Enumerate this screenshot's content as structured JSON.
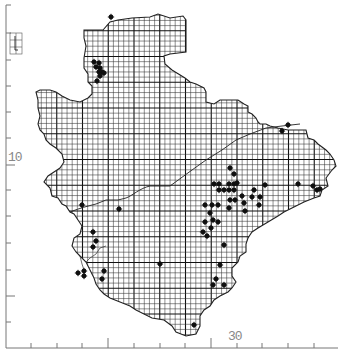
{
  "map": {
    "title": "",
    "axis_labels": {
      "left_10": "10",
      "bottom_30": "30"
    },
    "colors": {
      "background": "#ffffff",
      "grid": "#333333",
      "heavy_grid": "#111111",
      "outline": "#222222",
      "dot": "#111111",
      "axis": "#777777",
      "label": "#888888"
    },
    "grid": {
      "origin_x": 31,
      "origin_y": 5,
      "cell": 5.15,
      "major_every": 5
    },
    "left_ticks_y": [
      5,
      33,
      60,
      86,
      112,
      138,
      165,
      190,
      216,
      243,
      270,
      296,
      322
    ],
    "bottom_ticks_x": [
      31,
      57,
      82,
      108,
      134,
      160,
      185,
      211,
      237,
      262,
      288,
      314
    ],
    "records": [
      [
        111,
        17
      ],
      [
        94,
        62
      ],
      [
        99,
        63
      ],
      [
        96,
        67
      ],
      [
        100,
        68
      ],
      [
        99,
        72
      ],
      [
        102,
        72
      ],
      [
        100,
        76
      ],
      [
        97,
        81
      ],
      [
        104,
        73
      ],
      [
        288,
        125
      ],
      [
        282,
        131
      ],
      [
        230,
        168
      ],
      [
        234,
        174
      ],
      [
        214,
        184
      ],
      [
        219,
        184
      ],
      [
        229,
        184
      ],
      [
        234,
        184
      ],
      [
        219,
        190
      ],
      [
        224,
        190
      ],
      [
        229,
        190
      ],
      [
        234,
        190
      ],
      [
        237,
        183
      ],
      [
        242,
        196
      ],
      [
        265,
        185
      ],
      [
        298,
        184
      ],
      [
        313,
        186
      ],
      [
        317,
        190
      ],
      [
        320,
        189
      ],
      [
        230,
        200
      ],
      [
        235,
        200
      ],
      [
        229,
        208
      ],
      [
        254,
        190
      ],
      [
        252,
        197
      ],
      [
        260,
        197
      ],
      [
        245,
        211
      ],
      [
        259,
        205
      ],
      [
        244,
        203
      ],
      [
        205,
        205
      ],
      [
        212,
        205
      ],
      [
        218,
        205
      ],
      [
        210,
        213
      ],
      [
        213,
        220
      ],
      [
        205,
        222
      ],
      [
        218,
        222
      ],
      [
        211,
        228
      ],
      [
        203,
        232
      ],
      [
        207,
        236
      ],
      [
        82,
        205
      ],
      [
        119,
        209
      ],
      [
        93,
        232
      ],
      [
        96,
        241
      ],
      [
        78,
        273
      ],
      [
        84,
        271
      ],
      [
        84,
        276
      ],
      [
        104,
        271
      ],
      [
        102,
        279
      ],
      [
        160,
        264
      ],
      [
        93,
        247
      ],
      [
        224,
        245
      ],
      [
        220,
        265
      ],
      [
        216,
        279
      ],
      [
        224,
        285
      ],
      [
        213,
        285
      ],
      [
        194,
        325
      ]
    ]
  }
}
